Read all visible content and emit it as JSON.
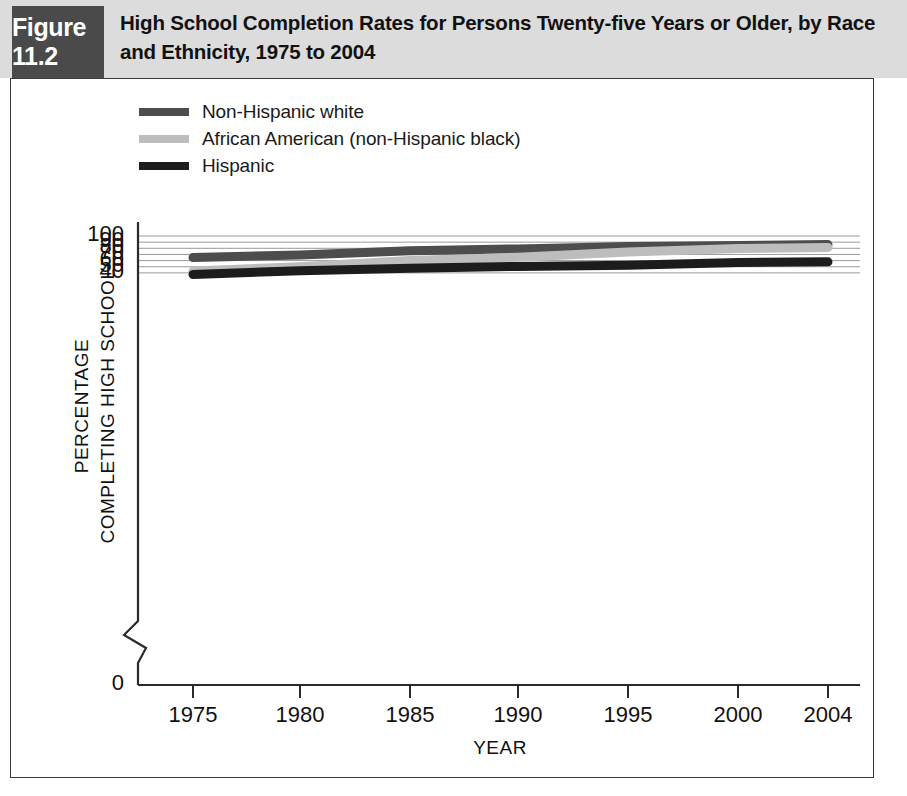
{
  "header": {
    "figure_label": "Figure 11.2",
    "title": "High School Completion Rates for Persons Twenty-five Years or Older, by Race and Ethnicity, 1975 to 2004",
    "band_color": "#dcdcdc",
    "label_box_color": "#4a4a4a"
  },
  "legend": {
    "position": "top-left-inside",
    "items": [
      {
        "label": "Non-Hispanic white",
        "color": "#4d4d4d"
      },
      {
        "label": "African American (non-Hispanic black)",
        "color": "#bdbdbd"
      },
      {
        "label": "Hispanic",
        "color": "#1c1c1c"
      }
    ]
  },
  "chart_data": {
    "type": "line",
    "title": "High School Completion Rates for Persons Twenty-five Years or Older, by Race and Ethnicity, 1975 to 2004",
    "xlabel": "YEAR",
    "ylabel": "PERCENTAGE COMPLETING HIGH SCHOOL",
    "ylabel_line1": "PERCENTAGE",
    "ylabel_line2": "COMPLETING HIGH SCHOOL",
    "x": [
      1975,
      1980,
      1985,
      1990,
      1995,
      2000,
      2004
    ],
    "xtick_labels": [
      "1975",
      "1980",
      "1985",
      "1990",
      "1995",
      "2000",
      "2004"
    ],
    "ytick_labels": [
      "100",
      "90",
      "80",
      "70",
      "60",
      "50",
      "40",
      "0"
    ],
    "yticks": [
      100,
      90,
      80,
      70,
      60,
      50,
      40,
      0
    ],
    "ylim": [
      36,
      100
    ],
    "axis_break": true,
    "axis_break_between": [
      0,
      40
    ],
    "grid": "horizontal",
    "series": [
      {
        "name": "Non-Hispanic white",
        "color": "#4d4d4d",
        "values": [
          65,
          69,
          76,
          79,
          83,
          84.5,
          86
        ]
      },
      {
        "name": "African American (non-Hispanic black)",
        "color": "#bdbdbd",
        "values": [
          43,
          50,
          60,
          65.5,
          74,
          79.5,
          81.5
        ]
      },
      {
        "name": "Hispanic",
        "color": "#1c1c1c",
        "values": [
          37.5,
          43.5,
          47.5,
          50.5,
          52.5,
          57,
          58
        ]
      }
    ]
  }
}
